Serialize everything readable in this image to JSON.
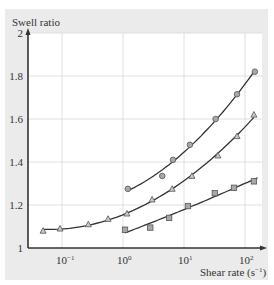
{
  "chart_data": {
    "type": "line",
    "title": "",
    "ylabel": "Swell ratio",
    "xlabel": "Shear rate (s⁻¹)",
    "xlabel_main": "Shear rate (s",
    "xlabel_sup": "−1",
    "xlabel_close": ")",
    "xscale": "log",
    "xlim": [
      0.035,
      200
    ],
    "ylim": [
      1,
      2
    ],
    "grid": true,
    "legend": "none",
    "y_ticks": [
      "1",
      "1.2",
      "1.4",
      "1.6",
      "1.8",
      "2"
    ],
    "x_ticks": [
      {
        "base": "10",
        "exp": "−1",
        "value": 0.1
      },
      {
        "base": "10",
        "exp": "0",
        "value": 1
      },
      {
        "base": "10",
        "exp": "1",
        "value": 10
      },
      {
        "base": "10",
        "exp": "2",
        "value": 100
      }
    ],
    "series": [
      {
        "name": "circles",
        "marker": "circle",
        "x": [
          1.2,
          4.4,
          6.6,
          12.5,
          33,
          74,
          145
        ],
        "y": [
          1.275,
          1.335,
          1.41,
          1.48,
          1.6,
          1.715,
          1.82
        ]
      },
      {
        "name": "triangles",
        "marker": "triangle",
        "x": [
          0.049,
          0.093,
          0.27,
          0.57,
          1.16,
          3.0,
          6.4,
          13.5,
          36,
          74,
          140
        ],
        "y": [
          1.08,
          1.09,
          1.11,
          1.135,
          1.16,
          1.225,
          1.275,
          1.335,
          1.43,
          1.52,
          1.62
        ]
      },
      {
        "name": "squares",
        "marker": "square",
        "x": [
          1.08,
          2.8,
          5.7,
          11.6,
          32,
          66,
          140
        ],
        "y": [
          1.085,
          1.095,
          1.14,
          1.195,
          1.255,
          1.28,
          1.31
        ]
      }
    ],
    "fit_curves": [
      {
        "name": "circles-fit",
        "x_range": [
          1.2,
          145
        ]
      },
      {
        "name": "triangles-fit",
        "x_range": [
          0.049,
          140
        ]
      },
      {
        "name": "squares-fit",
        "x_range": [
          1.08,
          160
        ]
      }
    ]
  }
}
